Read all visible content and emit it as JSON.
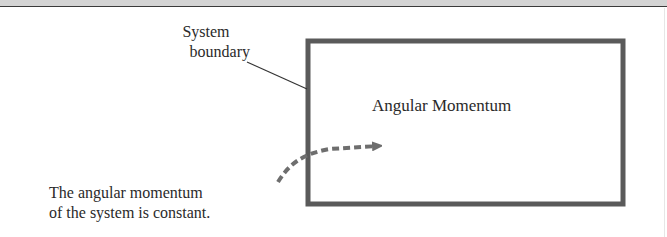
{
  "diagram": {
    "system_label": {
      "line1": "System",
      "line2": "boundary"
    },
    "box_label": "Angular Momentum",
    "note": {
      "line1": "The angular momentum",
      "line2": "of the system is constant."
    },
    "colors": {
      "box_stroke": "#5a5a5a",
      "arrow": "#6e6e6e",
      "leader_line": "#333333",
      "text": "#2a2a2a",
      "top_band": "#d4d4d4"
    }
  }
}
